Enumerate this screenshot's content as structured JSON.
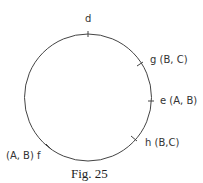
{
  "figure": {
    "caption": "Fig. 25",
    "points": {
      "d": {
        "label": "d"
      },
      "g": {
        "label": "g (B, C)"
      },
      "e": {
        "label": "e (A, B)"
      },
      "h": {
        "label": "h (B,C)"
      },
      "f": {
        "label": "(A, B) f"
      }
    }
  }
}
